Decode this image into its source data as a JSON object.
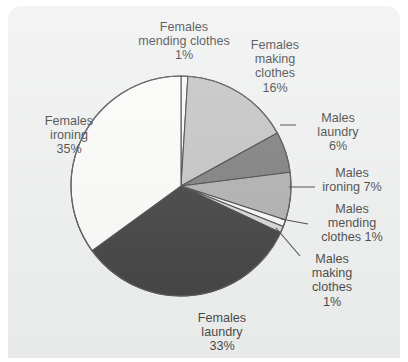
{
  "panel": {
    "background_color": "#eceded",
    "outline_color": "#000000"
  },
  "chart_data": {
    "type": "pie",
    "title": "",
    "subtitle": "",
    "xlabel": "",
    "ylabel": "",
    "legend_position": "none",
    "grid": false,
    "units": "percent",
    "total": 100,
    "start_angle_deg": 0,
    "direction": "clockwise",
    "center": {
      "x": 181,
      "y": 186
    },
    "radius": 110,
    "categories": [
      "Females mending clothes",
      "Females making clothes",
      "Males laundry",
      "Males ironing",
      "Males mending clothes",
      "Males making clothes",
      "Females laundry",
      "Females ironing"
    ],
    "values": [
      1,
      16,
      6,
      7,
      1,
      1,
      33,
      35
    ],
    "slice_colors": [
      "#f7f7f5",
      "#b4b4b4",
      "#5a5a5a",
      "#9a9a9a",
      "#f7f7f5",
      "#c9c9c9",
      "#0a0a0a",
      "#fbfbf9"
    ],
    "slices": [
      {
        "label": "Females mending clothes",
        "value": 1,
        "display": "1%",
        "color": "#f7f7f5"
      },
      {
        "label": "Females making clothes",
        "value": 16,
        "display": "16%",
        "color": "#b4b4b4"
      },
      {
        "label": "Males laundry",
        "value": 6,
        "display": "6%",
        "color": "#5a5a5a"
      },
      {
        "label": "Males ironing",
        "value": 7,
        "display": "7%",
        "color": "#9a9a9a"
      },
      {
        "label": "Males mending clothes",
        "value": 1,
        "display": "1%",
        "color": "#f7f7f5"
      },
      {
        "label": "Males making clothes",
        "value": 1,
        "display": "1%",
        "color": "#c9c9c9"
      },
      {
        "label": "Females laundry",
        "value": 33,
        "display": "33%",
        "color": "#0a0a0a"
      },
      {
        "label": "Females ironing",
        "value": 35,
        "display": "35%",
        "color": "#fbfbf9"
      }
    ]
  },
  "labels": {
    "females_mending_clothes": "Females\nmending clothes\n1%",
    "females_making_clothes": "Females\nmaking\nclothes\n16%",
    "males_laundry": "Males\nlaundry\n6%",
    "males_ironing": "Males\nironing 7%",
    "males_mending_clothes": "Males\nmending\nclothes 1%",
    "males_making_clothes": "Males\nmaking\nclothes\n1%",
    "females_laundry": "Females\nlaundry\n33%",
    "females_ironing": "Females\nironing\n35%"
  }
}
